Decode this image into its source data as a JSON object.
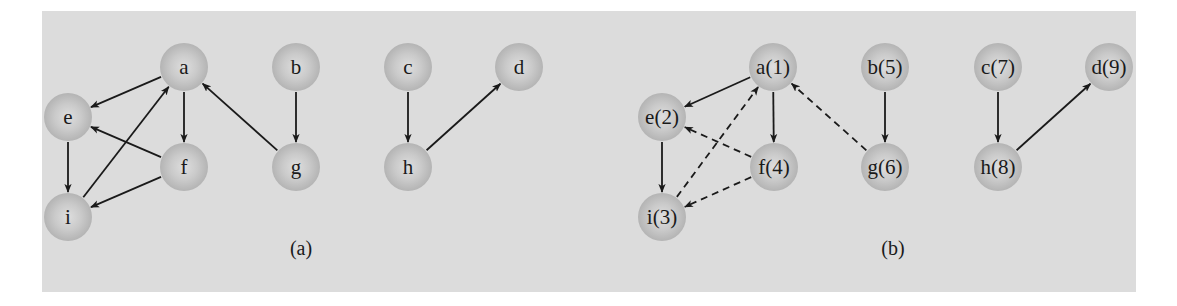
{
  "figure": {
    "background_color": "#dcdcdc",
    "node_color": "#c4c4c4",
    "edge_color": "#1a1a1a",
    "node_radius": 24,
    "panels": [
      {
        "id": "a",
        "caption": "(a)",
        "caption_pos": [
          301,
          248
        ],
        "nodes": [
          {
            "id": "a",
            "label": "a",
            "x": 184,
            "y": 67
          },
          {
            "id": "b",
            "label": "b",
            "x": 296,
            "y": 67
          },
          {
            "id": "c",
            "label": "c",
            "x": 408,
            "y": 67
          },
          {
            "id": "d",
            "label": "d",
            "x": 519,
            "y": 67
          },
          {
            "id": "e",
            "label": "e",
            "x": 68,
            "y": 117
          },
          {
            "id": "f",
            "label": "f",
            "x": 184,
            "y": 167
          },
          {
            "id": "g",
            "label": "g",
            "x": 296,
            "y": 167
          },
          {
            "id": "h",
            "label": "h",
            "x": 408,
            "y": 167
          },
          {
            "id": "i",
            "label": "i",
            "x": 68,
            "y": 217
          }
        ],
        "edges": [
          {
            "from": "a",
            "to": "e",
            "style": "solid"
          },
          {
            "from": "a",
            "to": "f",
            "style": "solid"
          },
          {
            "from": "e",
            "to": "i",
            "style": "solid"
          },
          {
            "from": "i",
            "to": "a",
            "style": "solid"
          },
          {
            "from": "f",
            "to": "e",
            "style": "solid"
          },
          {
            "from": "f",
            "to": "i",
            "style": "solid"
          },
          {
            "from": "g",
            "to": "a",
            "style": "solid"
          },
          {
            "from": "b",
            "to": "g",
            "style": "solid"
          },
          {
            "from": "c",
            "to": "h",
            "style": "solid"
          },
          {
            "from": "h",
            "to": "d",
            "style": "solid"
          }
        ]
      },
      {
        "id": "b",
        "caption": "(b)",
        "caption_pos": [
          893,
          248
        ],
        "nodes": [
          {
            "id": "a",
            "label": "a(1)",
            "x": 773,
            "y": 67
          },
          {
            "id": "b",
            "label": "b(5)",
            "x": 885,
            "y": 67
          },
          {
            "id": "c",
            "label": "c(7)",
            "x": 998,
            "y": 67
          },
          {
            "id": "d",
            "label": "d(9)",
            "x": 1109,
            "y": 67
          },
          {
            "id": "e",
            "label": "e(2)",
            "x": 662,
            "y": 117
          },
          {
            "id": "f",
            "label": "f(4)",
            "x": 774,
            "y": 167
          },
          {
            "id": "g",
            "label": "g(6)",
            "x": 885,
            "y": 167
          },
          {
            "id": "h",
            "label": "h(8)",
            "x": 998,
            "y": 167
          },
          {
            "id": "i",
            "label": "i(3)",
            "x": 662,
            "y": 217
          }
        ],
        "edges": [
          {
            "from": "a",
            "to": "e",
            "style": "solid"
          },
          {
            "from": "a",
            "to": "f",
            "style": "solid"
          },
          {
            "from": "e",
            "to": "i",
            "style": "solid"
          },
          {
            "from": "i",
            "to": "a",
            "style": "dashed"
          },
          {
            "from": "f",
            "to": "e",
            "style": "dashed"
          },
          {
            "from": "f",
            "to": "i",
            "style": "dashed"
          },
          {
            "from": "g",
            "to": "a",
            "style": "dashed"
          },
          {
            "from": "b",
            "to": "g",
            "style": "solid"
          },
          {
            "from": "c",
            "to": "h",
            "style": "solid"
          },
          {
            "from": "h",
            "to": "d",
            "style": "solid"
          }
        ]
      }
    ]
  }
}
